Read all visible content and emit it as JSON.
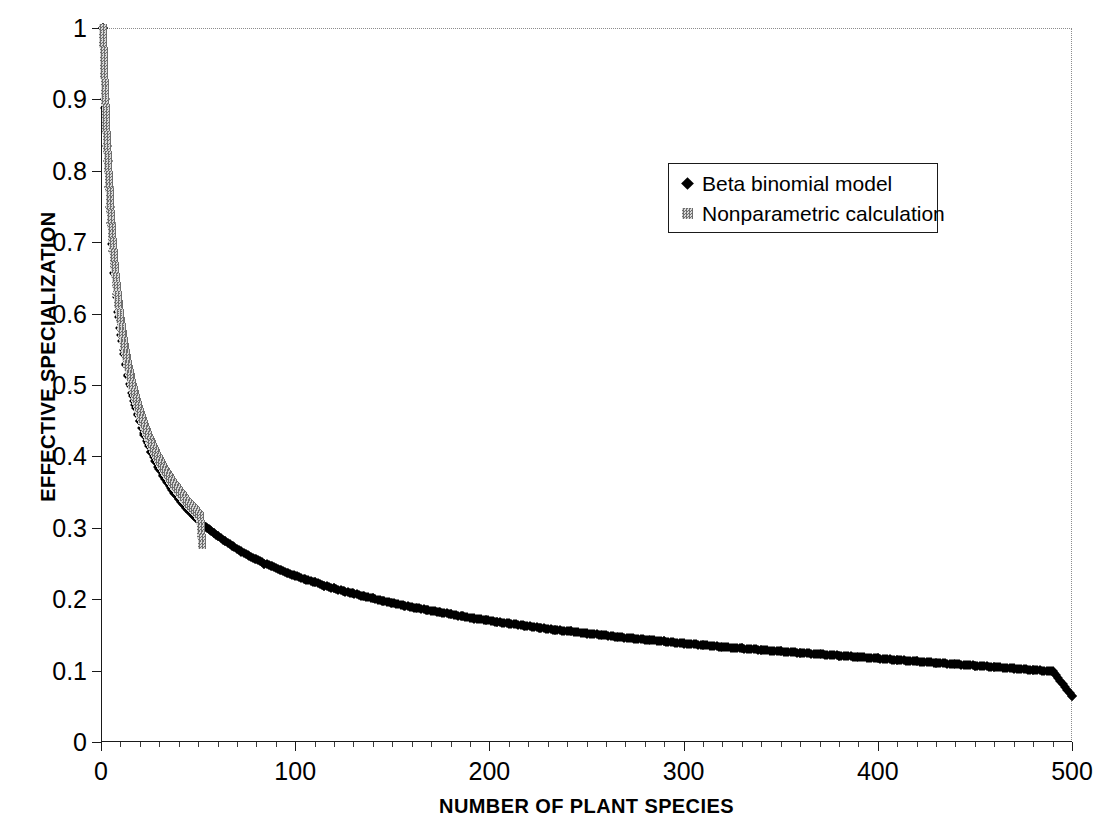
{
  "chart_data": {
    "type": "scatter",
    "title": "",
    "xlabel": "NUMBER OF PLANT SPECIES",
    "ylabel": "EFFECTIVE SPECIALIZATION",
    "xlim": [
      0,
      500
    ],
    "ylim": [
      0,
      1
    ],
    "xticks": [
      0,
      100,
      200,
      300,
      400,
      500
    ],
    "xtick_labels": [
      "0",
      "100",
      "200",
      "300",
      "400",
      "500"
    ],
    "yticks": [
      0,
      0.1,
      0.2,
      0.3,
      0.4,
      0.5,
      0.6,
      0.7,
      0.8,
      0.9,
      1
    ],
    "ytick_labels": [
      "0",
      "0.1",
      "0.2",
      "0.3",
      "0.4",
      "0.5",
      "0.6",
      "0.7",
      "0.8",
      "0.9",
      "1"
    ],
    "grid": false,
    "legend_position": "upper-center",
    "series": [
      {
        "name": "Beta binomial model",
        "marker": "diamond",
        "color": "#000000",
        "x": [
          1,
          2,
          3,
          4,
          5,
          6,
          7,
          8,
          9,
          10,
          11,
          12,
          13,
          14,
          15,
          16,
          17,
          18,
          19,
          20,
          22,
          24,
          26,
          28,
          30,
          32,
          34,
          36,
          38,
          40,
          42,
          44,
          46,
          48,
          50,
          52,
          54,
          56,
          58,
          60,
          64,
          68,
          72,
          76,
          80,
          84,
          88,
          92,
          96,
          100,
          105,
          110,
          115,
          120,
          125,
          130,
          135,
          140,
          145,
          150,
          156,
          162,
          168,
          174,
          180,
          186,
          192,
          198,
          204,
          210,
          218,
          226,
          234,
          242,
          250,
          258,
          266,
          274,
          282,
          290,
          300,
          310,
          320,
          330,
          340,
          350,
          360,
          370,
          380,
          390,
          400,
          410,
          420,
          430,
          440,
          450,
          460,
          470,
          480,
          490,
          500
        ],
        "y": [
          1,
          0.9,
          0.835,
          0.778,
          0.727,
          0.688,
          0.655,
          0.627,
          0.602,
          0.58,
          0.561,
          0.544,
          0.528,
          0.514,
          0.501,
          0.489,
          0.478,
          0.468,
          0.458,
          0.449,
          0.433,
          0.419,
          0.406,
          0.394,
          0.383,
          0.373,
          0.364,
          0.356,
          0.348,
          0.341,
          0.334,
          0.328,
          0.322,
          0.316,
          0.311,
          0.306,
          0.301,
          0.297,
          0.293,
          0.289,
          0.281,
          0.274,
          0.267,
          0.261,
          0.256,
          0.25,
          0.246,
          0.241,
          0.237,
          0.233,
          0.228,
          0.224,
          0.219,
          0.215,
          0.211,
          0.208,
          0.204,
          0.201,
          0.198,
          0.195,
          0.191,
          0.188,
          0.185,
          0.182,
          0.179,
          0.176,
          0.173,
          0.171,
          0.168,
          0.166,
          0.163,
          0.16,
          0.157,
          0.155,
          0.152,
          0.15,
          0.147,
          0.145,
          0.143,
          0.141,
          0.138,
          0.136,
          0.133,
          0.131,
          0.129,
          0.127,
          0.125,
          0.123,
          0.121,
          0.119,
          0.117,
          0.115,
          0.113,
          0.111,
          0.109,
          0.107,
          0.105,
          0.103,
          0.101,
          0.099,
          0.065
        ]
      },
      {
        "name": "Nonparametric calculation",
        "marker": "square",
        "color": "#8c8c8c",
        "x": [
          1,
          2,
          3,
          4,
          5,
          6,
          7,
          8,
          9,
          10,
          11,
          12,
          13,
          14,
          15,
          16,
          17,
          18,
          19,
          20,
          21,
          22,
          23,
          24,
          25,
          26,
          27,
          28,
          29,
          30,
          31,
          32,
          33,
          34,
          35,
          36,
          37,
          38,
          39,
          40,
          41,
          42,
          43,
          44,
          45,
          46,
          47,
          48,
          49,
          50,
          51,
          52
        ],
        "y": [
          1,
          0.91,
          0.846,
          0.79,
          0.74,
          0.7,
          0.667,
          0.639,
          0.614,
          0.592,
          0.573,
          0.556,
          0.54,
          0.526,
          0.513,
          0.501,
          0.49,
          0.48,
          0.47,
          0.461,
          0.453,
          0.445,
          0.437,
          0.43,
          0.423,
          0.417,
          0.411,
          0.405,
          0.399,
          0.394,
          0.389,
          0.384,
          0.379,
          0.375,
          0.371,
          0.366,
          0.362,
          0.358,
          0.355,
          0.351,
          0.347,
          0.344,
          0.34,
          0.337,
          0.334,
          0.331,
          0.328,
          0.325,
          0.322,
          0.319,
          0.316,
          0.276
        ]
      }
    ],
    "legend": [
      {
        "label": "Beta binomial model",
        "marker": "diamond",
        "color": "#000000"
      },
      {
        "label": "Nonparametric calculation",
        "marker": "square",
        "color": "#8c8c8c"
      }
    ]
  }
}
